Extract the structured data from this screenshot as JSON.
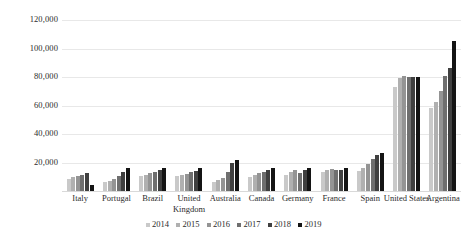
{
  "chart_data": {
    "type": "bar",
    "title": "",
    "subtitle": "",
    "xlabel": "",
    "ylabel": "",
    "ylim": [
      0,
      120000
    ],
    "ytick_step": 20000,
    "ytick_labels": [
      "20,000",
      "40,000",
      "60,000",
      "80,000",
      "100,000",
      "120,000"
    ],
    "ytick_values": [
      20000,
      40000,
      60000,
      80000,
      100000,
      120000
    ],
    "grid": true,
    "grid_axis": "y",
    "legend_position": "bottom",
    "categories": [
      "Italy",
      "Portugal",
      "Brazil",
      "United Kingdom",
      "Australia",
      "Canada",
      "Germany",
      "France",
      "Spain",
      "United States",
      "Argentina"
    ],
    "series": [
      {
        "name": "2014",
        "color": "#c9c9c9",
        "values": [
          8500,
          6000,
          10500,
          10500,
          6500,
          10000,
          11500,
          13000,
          14000,
          73000,
          58500
        ]
      },
      {
        "name": "2015",
        "color": "#b0b0b0",
        "values": [
          9500,
          7000,
          11500,
          11500,
          7500,
          11500,
          13000,
          14500,
          16500,
          79500,
          62500
        ]
      },
      {
        "name": "2016",
        "color": "#949494",
        "values": [
          10500,
          8500,
          12500,
          12000,
          9000,
          12500,
          14500,
          15500,
          19000,
          80500,
          70500
        ]
      },
      {
        "name": "2017",
        "color": "#6f6f6f",
        "values": [
          11500,
          10500,
          13500,
          13000,
          13500,
          13500,
          12500,
          15000,
          22500,
          80000,
          81000
        ]
      },
      {
        "name": "2018",
        "color": "#404040",
        "values": [
          12500,
          13000,
          14500,
          14000,
          19500,
          15000,
          14500,
          14500,
          25500,
          80000,
          86000
        ]
      },
      {
        "name": "2019",
        "color": "#141414",
        "values": [
          4500,
          16500,
          16000,
          16500,
          22000,
          16500,
          16000,
          16500,
          27000,
          80000,
          105500
        ]
      }
    ]
  }
}
